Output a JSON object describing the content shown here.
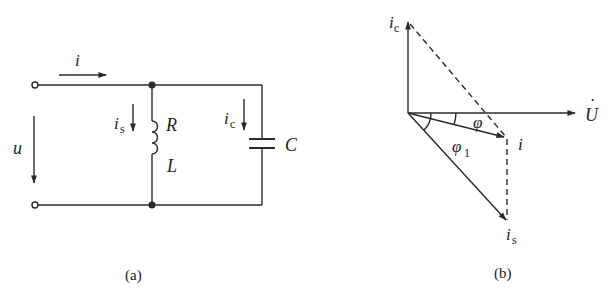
{
  "figure_a": {
    "caption": "(a)",
    "labels": {
      "current_total": "i",
      "voltage": "u",
      "current_s": "i",
      "current_s_sub": "s",
      "resistor": "R",
      "inductor": "L",
      "current_c": "i",
      "current_c_sub": "c",
      "capacitor": "C"
    }
  },
  "figure_b": {
    "caption": "(b)",
    "labels": {
      "phasor_ic": "i",
      "phasor_ic_sub": "c",
      "phasor_U": "U",
      "phasor_U_dot": "·",
      "phasor_i": "i",
      "phasor_is": "i",
      "phasor_is_sub": "s",
      "angle_phi": "φ",
      "angle_phi1": "φ",
      "angle_phi1_sub": "1"
    }
  },
  "colors": {
    "line": "#2a2a2a",
    "background": "#ffffff"
  }
}
